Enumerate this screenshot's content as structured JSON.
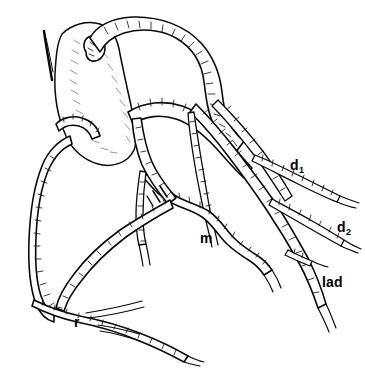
{
  "figure": {
    "background_color": "#ffffff",
    "ink_color": "#0a0a0a",
    "width": 365,
    "height": 383
  },
  "labels": [
    {
      "id": "d1",
      "base": "d",
      "subscript": "1",
      "meaning": "first diagonal branch",
      "x": 290,
      "y": 170
    },
    {
      "id": "d2",
      "base": "d",
      "subscript": "2",
      "meaning": "second diagonal branch",
      "x": 337,
      "y": 232
    },
    {
      "id": "lad",
      "base": "lad",
      "subscript": "",
      "meaning": "left anterior descending artery",
      "x": 322,
      "y": 287
    },
    {
      "id": "m",
      "base": "m",
      "subscript": "",
      "meaning": "marginal branch",
      "x": 200,
      "y": 243
    },
    {
      "id": "r",
      "base": "r",
      "subscript": "",
      "meaning": "right coronary artery",
      "x": 74,
      "y": 327
    }
  ],
  "structures": [
    {
      "name": "aortic-root",
      "label": "aortic root and atrial appendage"
    },
    {
      "name": "arch-vessel",
      "label": "great arching vessel"
    },
    {
      "name": "lad-trunk",
      "label": "left anterior descending trunk"
    },
    {
      "name": "diagonal-1",
      "label": "first diagonal branch"
    },
    {
      "name": "diagonal-2",
      "label": "second diagonal branch"
    },
    {
      "name": "marginal-branch",
      "label": "marginal branch"
    },
    {
      "name": "rca-trunk",
      "label": "right coronary artery trunk"
    },
    {
      "name": "posterior-descending",
      "label": "posterior descending branches"
    }
  ]
}
